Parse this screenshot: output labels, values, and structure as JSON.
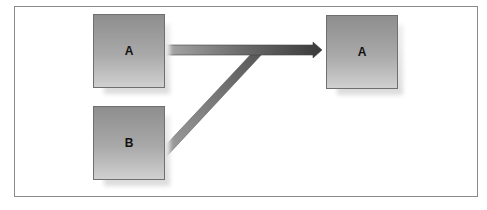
{
  "diagram": {
    "nodes": [
      {
        "id": "source-a",
        "label": "A"
      },
      {
        "id": "source-b",
        "label": "B"
      },
      {
        "id": "target-a",
        "label": "A"
      }
    ],
    "edges": [
      {
        "from": "source-a",
        "to": "target-a",
        "style": "thick arrow"
      },
      {
        "from": "source-b",
        "to": "target-a",
        "style": "thick bar merging into arrow"
      }
    ],
    "colors": {
      "box_top": "#8e8e8e",
      "box_bottom": "#d0d0d0",
      "box_border": "#6f6f6f",
      "arrow_dark": "#3c3c3c",
      "arrow_light": "#9a9a9a",
      "frame_border": "#8a8a8a"
    }
  }
}
